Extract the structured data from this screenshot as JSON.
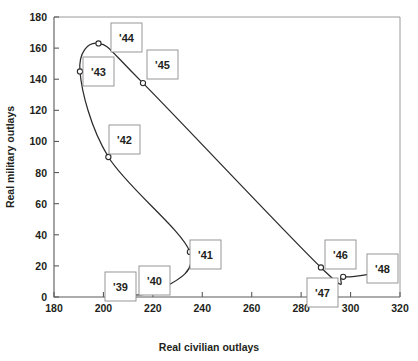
{
  "chart_data": {
    "type": "line",
    "title": "",
    "xlabel": "Real civilian outlays",
    "ylabel": "Real military outlays",
    "xlim": [
      180,
      320
    ],
    "ylim": [
      0,
      180
    ],
    "xticks": [
      "180",
      "200",
      "220",
      "240",
      "260",
      "280",
      "300",
      "320"
    ],
    "xtick_values": [
      180,
      200,
      220,
      240,
      260,
      280,
      300,
      320
    ],
    "yticks": [
      "0",
      "20",
      "40",
      "60",
      "80",
      "100",
      "120",
      "140",
      "160",
      "180"
    ],
    "ytick_values": [
      0,
      20,
      40,
      60,
      80,
      100,
      120,
      140,
      160,
      180
    ],
    "grid": false,
    "legend": "none",
    "marker": "open-circle",
    "series": [
      {
        "name": "Real outlays path 1939-1948",
        "points": [
          {
            "label": "'39",
            "x": 206,
            "y": 1.5
          },
          {
            "label": "'40",
            "x": 222,
            "y": 4
          },
          {
            "label": "'41",
            "x": 235,
            "y": 29
          },
          {
            "label": "'42",
            "x": 202,
            "y": 90
          },
          {
            "label": "'43",
            "x": 190.5,
            "y": 145
          },
          {
            "label": "'44",
            "x": 198,
            "y": 163
          },
          {
            "label": "'45",
            "x": 216,
            "y": 137.5
          },
          {
            "label": "'46",
            "x": 288,
            "y": 19
          },
          {
            "label": "'47",
            "x": 297,
            "y": 13
          },
          {
            "label": "'48",
            "x": 309,
            "y": 15
          }
        ]
      }
    ],
    "annotations": [
      {
        "text": "'39",
        "box_x": 105,
        "box_y": 272,
        "w": 31,
        "h": 29
      },
      {
        "text": "'40",
        "box_x": 139,
        "box_y": 266,
        "w": 31,
        "h": 29
      },
      {
        "text": "'41",
        "box_x": 190,
        "box_y": 240,
        "w": 31,
        "h": 29
      },
      {
        "text": "'42",
        "box_x": 109,
        "box_y": 125,
        "w": 31,
        "h": 29
      },
      {
        "text": "'43",
        "box_x": 83,
        "box_y": 57,
        "w": 31,
        "h": 29
      },
      {
        "text": "'44",
        "box_x": 111,
        "box_y": 23,
        "w": 31,
        "h": 29
      },
      {
        "text": "'45",
        "box_x": 147,
        "box_y": 50,
        "w": 31,
        "h": 29
      },
      {
        "text": "'46",
        "box_x": 325,
        "box_y": 240,
        "w": 31,
        "h": 29
      },
      {
        "text": "'47",
        "box_x": 307,
        "box_y": 278,
        "w": 31,
        "h": 29
      },
      {
        "text": "'48",
        "box_x": 367,
        "box_y": 254,
        "w": 31,
        "h": 29
      }
    ]
  },
  "colors": {
    "curve": "#2b2b2b",
    "axis": "#5a5a5a",
    "frame": "#9a9a9a",
    "label_box_border": "#8c8c8c",
    "background": "#ffffff",
    "text": "#231f20"
  }
}
